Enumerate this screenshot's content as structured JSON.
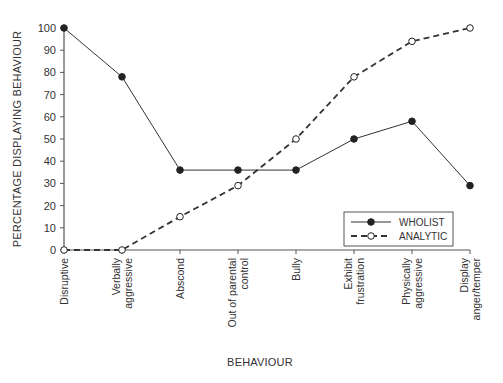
{
  "chart_data": {
    "type": "line",
    "title": "",
    "xlabel": "BEHAVIOUR",
    "ylabel": "PERCENTAGE DISPLAYING BEHAVIOUR",
    "ylim": [
      0,
      100
    ],
    "yticks": [
      0,
      10,
      20,
      30,
      40,
      50,
      60,
      70,
      80,
      90,
      100
    ],
    "grid": false,
    "legend_position": "lower right (inside plot)",
    "categories": [
      [
        "Disruptive"
      ],
      [
        "Verbally",
        "aggressive"
      ],
      [
        "Abscond"
      ],
      [
        "Out of parental",
        "control"
      ],
      [
        "Bully"
      ],
      [
        "Exhibit",
        "frustration"
      ],
      [
        "Physically",
        "aggressive"
      ],
      [
        "Display",
        "anger/temper"
      ]
    ],
    "series": [
      {
        "name": "WHOLIST",
        "style": "solid",
        "marker": "filled-circle",
        "color": "#333333",
        "values": [
          100,
          78,
          36,
          36,
          36,
          50,
          58,
          29
        ]
      },
      {
        "name": "ANALYTIC",
        "style": "dashed",
        "marker": "open-circle",
        "color": "#333333",
        "values": [
          0,
          0,
          15,
          29,
          50,
          78,
          94,
          100
        ]
      }
    ]
  }
}
